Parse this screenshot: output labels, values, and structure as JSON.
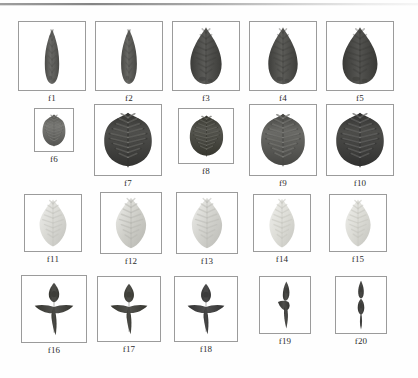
{
  "figure": {
    "background_color": "#fefefe",
    "frame_border_color": "#9b9b9b",
    "caption_color": "#2c2c2c",
    "rows": 4,
    "columns": 5,
    "total_items": 20,
    "top_scan_line_color": "#6f6f6f"
  },
  "items": [
    {
      "id": "f1",
      "label": "f1",
      "row": 1,
      "col": 1,
      "shape": "lanceolate-narrow",
      "fill": "#6b6b68",
      "stroke": "#4a4a47",
      "box": {
        "x": 18,
        "y": 21,
        "w": 68,
        "h": 70
      },
      "leaf": {
        "w": 20,
        "h": 57,
        "tip": "acuminate",
        "tone": "dark"
      }
    },
    {
      "id": "f2",
      "label": "f2",
      "row": 1,
      "col": 2,
      "shape": "lanceolate-narrow",
      "fill": "#696965",
      "stroke": "#474744",
      "box": {
        "x": 95,
        "y": 21,
        "w": 68,
        "h": 70
      },
      "leaf": {
        "w": 22,
        "h": 57,
        "tip": "acuminate",
        "tone": "dark"
      }
    },
    {
      "id": "f3",
      "label": "f3",
      "row": 1,
      "col": 3,
      "shape": "ovate-lanceolate",
      "fill": "#5b5b58",
      "stroke": "#3c3c39",
      "box": {
        "x": 172,
        "y": 21,
        "w": 68,
        "h": 70
      },
      "leaf": {
        "w": 34,
        "h": 58,
        "tip": "acuminate",
        "tone": "dark"
      }
    },
    {
      "id": "f4",
      "label": "f4",
      "row": 1,
      "col": 4,
      "shape": "obovate-lanceolate",
      "fill": "#5e5e5a",
      "stroke": "#3e3e3b",
      "box": {
        "x": 249,
        "y": 21,
        "w": 68,
        "h": 70
      },
      "leaf": {
        "w": 32,
        "h": 58,
        "tip": "acuminate",
        "tone": "dark"
      }
    },
    {
      "id": "f5",
      "label": "f5",
      "row": 1,
      "col": 5,
      "shape": "ovate-lanceolate-veined",
      "fill": "#555552",
      "stroke": "#393936",
      "box": {
        "x": 326,
        "y": 21,
        "w": 68,
        "h": 70
      },
      "leaf": {
        "w": 38,
        "h": 58,
        "tip": "acuminate",
        "tone": "very-dark"
      }
    },
    {
      "id": "f6",
      "label": "f6",
      "row": 2,
      "col": 1,
      "shape": "ovate-veined",
      "fill": "#7a7a76",
      "stroke": "#545451",
      "box": {
        "x": 34,
        "y": 108,
        "w": 40,
        "h": 44
      },
      "leaf": {
        "w": 24,
        "h": 33,
        "tip": "acute",
        "tone": "mid"
      }
    },
    {
      "id": "f7",
      "label": "f7",
      "row": 2,
      "col": 2,
      "shape": "ovate-veined",
      "fill": "#4f4f4c",
      "stroke": "#333331",
      "box": {
        "x": 94,
        "y": 104,
        "w": 68,
        "h": 72
      },
      "leaf": {
        "w": 50,
        "h": 56,
        "tip": "acute",
        "tone": "very-dark"
      }
    },
    {
      "id": "f8",
      "label": "f8",
      "row": 2,
      "col": 3,
      "shape": "ovate-veined",
      "fill": "#55554f",
      "stroke": "#37372f",
      "box": {
        "x": 178,
        "y": 108,
        "w": 56,
        "h": 56
      },
      "leaf": {
        "w": 35,
        "h": 42,
        "tip": "acute",
        "tone": "dark"
      }
    },
    {
      "id": "f9",
      "label": "f9",
      "row": 2,
      "col": 4,
      "shape": "ovate-veined",
      "fill": "#6a6a66",
      "stroke": "#474744",
      "box": {
        "x": 249,
        "y": 104,
        "w": 68,
        "h": 72
      },
      "leaf": {
        "w": 46,
        "h": 54,
        "tip": "acute",
        "tone": "mid-dark"
      }
    },
    {
      "id": "f10",
      "label": "f10",
      "row": 2,
      "col": 5,
      "shape": "ovate-veined",
      "fill": "#4d4d4a",
      "stroke": "#313130",
      "box": {
        "x": 326,
        "y": 104,
        "w": 68,
        "h": 72
      },
      "leaf": {
        "w": 50,
        "h": 56,
        "tip": "acute",
        "tone": "very-dark"
      }
    },
    {
      "id": "f11",
      "label": "f11",
      "row": 3,
      "col": 1,
      "shape": "elliptic-pale",
      "fill": "#d9d9d4",
      "stroke": "#c2c2bd",
      "box": {
        "x": 24,
        "y": 194,
        "w": 58,
        "h": 58
      },
      "leaf": {
        "w": 32,
        "h": 48,
        "tip": "acute",
        "tone": "pale"
      }
    },
    {
      "id": "f12",
      "label": "f12",
      "row": 3,
      "col": 2,
      "shape": "elliptic-pale-veined",
      "fill": "#cfcfc9",
      "stroke": "#b6b6b0",
      "box": {
        "x": 100,
        "y": 192,
        "w": 62,
        "h": 62
      },
      "leaf": {
        "w": 36,
        "h": 52,
        "tip": "acute",
        "tone": "pale"
      }
    },
    {
      "id": "f13",
      "label": "f13",
      "row": 3,
      "col": 3,
      "shape": "elliptic-pale-veined",
      "fill": "#d3d3ce",
      "stroke": "#bbbbb6",
      "box": {
        "x": 176,
        "y": 192,
        "w": 62,
        "h": 62
      },
      "leaf": {
        "w": 36,
        "h": 52,
        "tip": "acute",
        "tone": "pale"
      }
    },
    {
      "id": "f14",
      "label": "f14",
      "row": 3,
      "col": 4,
      "shape": "elliptic-pale",
      "fill": "#dedeD8",
      "stroke": "#c6c6c0",
      "box": {
        "x": 253,
        "y": 194,
        "w": 58,
        "h": 58
      },
      "leaf": {
        "w": 30,
        "h": 50,
        "tip": "acute",
        "tone": "pale"
      }
    },
    {
      "id": "f15",
      "label": "f15",
      "row": 3,
      "col": 5,
      "shape": "elliptic-pale",
      "fill": "#dcdcd6",
      "stroke": "#c4c4be",
      "box": {
        "x": 329,
        "y": 194,
        "w": 58,
        "h": 58
      },
      "leaf": {
        "w": 30,
        "h": 48,
        "tip": "acute",
        "tone": "pale"
      }
    },
    {
      "id": "f16",
      "label": "f16",
      "row": 4,
      "col": 1,
      "shape": "dagger-cross",
      "fill": "#52524f",
      "stroke": "#35352f",
      "box": {
        "x": 21,
        "y": 275,
        "w": 66,
        "h": 68
      },
      "glyph": {
        "w": 42,
        "h": 54,
        "tone": "dark"
      }
    },
    {
      "id": "f17",
      "label": "f17",
      "row": 4,
      "col": 2,
      "shape": "dagger-cross",
      "fill": "#53534f",
      "stroke": "#36362f",
      "box": {
        "x": 97,
        "y": 276,
        "w": 64,
        "h": 66
      },
      "glyph": {
        "w": 40,
        "h": 52,
        "tone": "dark"
      }
    },
    {
      "id": "f18",
      "label": "f18",
      "row": 4,
      "col": 3,
      "shape": "dagger-cross",
      "fill": "#505050",
      "stroke": "#333333",
      "box": {
        "x": 174,
        "y": 276,
        "w": 64,
        "h": 66
      },
      "glyph": {
        "w": 40,
        "h": 52,
        "tone": "dark"
      }
    },
    {
      "id": "f19",
      "label": "f19",
      "row": 4,
      "col": 4,
      "shape": "dagger-narrow",
      "fill": "#4f4f4c",
      "stroke": "#333331",
      "box": {
        "x": 259,
        "y": 276,
        "w": 52,
        "h": 58
      },
      "glyph": {
        "w": 22,
        "h": 48,
        "tone": "dark"
      }
    },
    {
      "id": "f20",
      "label": "f20",
      "row": 4,
      "col": 5,
      "shape": "dagger-spindle",
      "fill": "#4e4e4b",
      "stroke": "#323230",
      "box": {
        "x": 335,
        "y": 276,
        "w": 52,
        "h": 58
      },
      "glyph": {
        "w": 18,
        "h": 50,
        "tone": "dark"
      }
    }
  ]
}
